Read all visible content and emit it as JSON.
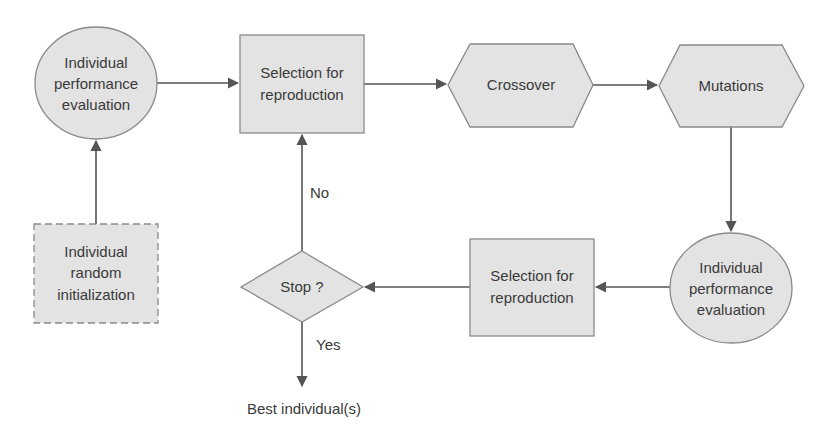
{
  "diagram": {
    "type": "flowchart",
    "nodes": {
      "eval1": {
        "shape": "circle",
        "lines": [
          "Individual",
          "performance",
          "evaluation"
        ]
      },
      "select1": {
        "shape": "rectangle",
        "lines": [
          "Selection for",
          "reproduction"
        ]
      },
      "crossover": {
        "shape": "hexagon",
        "lines": [
          "Crossover"
        ]
      },
      "mutations": {
        "shape": "hexagon",
        "lines": [
          "Mutations"
        ]
      },
      "init": {
        "shape": "dashed-rectangle",
        "lines": [
          "Individual",
          "random",
          "initialization"
        ]
      },
      "stop": {
        "shape": "diamond",
        "lines": [
          "Stop ?"
        ]
      },
      "select2": {
        "shape": "rectangle",
        "lines": [
          "Selection for",
          "reproduction"
        ]
      },
      "eval2": {
        "shape": "circle",
        "lines": [
          "Individual",
          "performance",
          "evaluation"
        ]
      },
      "best": {
        "shape": "text",
        "lines": [
          "Best individual(s)"
        ]
      }
    },
    "edges": [
      {
        "from": "init",
        "to": "eval1",
        "label": ""
      },
      {
        "from": "eval1",
        "to": "select1",
        "label": ""
      },
      {
        "from": "select1",
        "to": "crossover",
        "label": ""
      },
      {
        "from": "crossover",
        "to": "mutations",
        "label": ""
      },
      {
        "from": "mutations",
        "to": "eval2",
        "label": ""
      },
      {
        "from": "eval2",
        "to": "select2",
        "label": ""
      },
      {
        "from": "select2",
        "to": "stop",
        "label": ""
      },
      {
        "from": "stop",
        "to": "select1",
        "label": "No"
      },
      {
        "from": "stop",
        "to": "best",
        "label": "Yes"
      }
    ],
    "edge_labels": {
      "no": "No",
      "yes": "Yes"
    },
    "colors": {
      "fill": "#e3e3e3",
      "stroke": "#8a8a8a",
      "line": "#555555",
      "text": "#3a3a3a"
    }
  }
}
